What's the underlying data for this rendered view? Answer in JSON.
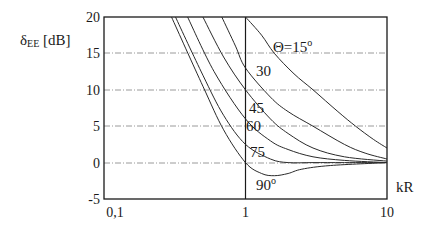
{
  "chart_data": {
    "type": "line",
    "title": "",
    "xlabel": "kR",
    "ylabel": "δEE [dB]",
    "xscale": "log",
    "xlim": [
      0.1,
      10
    ],
    "ylim": [
      -5,
      20
    ],
    "xticks": [
      "0,1",
      "1",
      "10"
    ],
    "yticks": [
      "20",
      "15",
      "10",
      "5",
      "0",
      "-5"
    ],
    "grid": "horizontal dashed at 15, 10, 5, 0; vertical solid at kR=1",
    "legend": "inline labels",
    "series": [
      {
        "name": "Θ=15°",
        "label": "Θ=15",
        "x": [
          1.0,
          1.3,
          1.6,
          2.2,
          3.0,
          4.5,
          6.0,
          8.0,
          10.0
        ],
        "y": [
          20,
          17.5,
          15,
          12.2,
          10,
          7,
          5,
          3.2,
          2
        ]
      },
      {
        "name": "30°",
        "label": "30",
        "x": [
          0.68,
          0.85,
          1.0,
          1.5,
          2.0,
          3.0,
          5.0,
          7.0,
          10.0
        ],
        "y": [
          20,
          16,
          13,
          9,
          7,
          5,
          2.5,
          1.3,
          0.5
        ]
      },
      {
        "name": "45°",
        "label": "45",
        "x": [
          0.5,
          0.7,
          1.0,
          1.5,
          2.0,
          3.0,
          5.0,
          10.0
        ],
        "y": [
          20,
          14.5,
          10,
          6,
          4,
          2,
          0.8,
          0.2
        ]
      },
      {
        "name": "60°",
        "label": "60",
        "x": [
          0.39,
          0.6,
          1.0,
          1.5,
          2.0,
          3.0,
          5.0,
          10.0
        ],
        "y": [
          20,
          12.5,
          6,
          3,
          1.8,
          0.8,
          0.3,
          0
        ]
      },
      {
        "name": "75°",
        "label": "75",
        "x": [
          0.32,
          0.5,
          0.7,
          1.0,
          1.5,
          2.0,
          3.0,
          5.0,
          10.0
        ],
        "y": [
          20,
          12,
          6.5,
          2.5,
          0.5,
          0,
          0,
          0,
          0
        ]
      },
      {
        "name": "90°",
        "label": "90",
        "x": [
          0.3,
          0.5,
          0.7,
          1.0,
          1.3,
          1.6,
          2.0,
          2.5,
          4.0,
          10.0
        ],
        "y": [
          20,
          10.5,
          4.5,
          0,
          -1.5,
          -1.8,
          -1.5,
          -0.9,
          -0.4,
          0
        ]
      }
    ]
  },
  "labels": {
    "ylabel_main": "δ",
    "ylabel_sub": "EE",
    "ylabel_unit": " [dB]",
    "xlabel": "kR",
    "theta_prefix": "Θ=15",
    "deg": "o",
    "l30": "30",
    "l45": "45",
    "l60": "60",
    "l75": "75",
    "l90": "90",
    "y20": "20",
    "y15": "15",
    "y10": "10",
    "y5": "5",
    "y0": "0",
    "ym5": "-5",
    "x01": "0,1",
    "x1": "1",
    "x10": "10"
  },
  "colors": {
    "line": "#2a2a2a",
    "grid": "#9a9a9a",
    "axis": "#1a1a1a"
  }
}
